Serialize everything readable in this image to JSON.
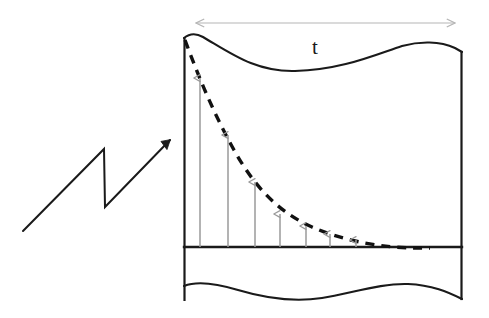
{
  "figure": {
    "kind": "diagram",
    "background_color": "#ffffff",
    "width": 489,
    "height": 318,
    "stroke_color": "#1a1a1a",
    "dash_color": "#111111",
    "arrow_color": "#9a9a9a",
    "dimension_color": "#b5b5b5"
  },
  "dimension_arrow": {
    "label": "t",
    "label_x": 312,
    "label_y": 37,
    "line_y": 23,
    "x_start": 196,
    "x_end": 455,
    "double_headed": true,
    "color": "#b5b5b5"
  },
  "panel": {
    "left": 184,
    "right": 462,
    "top_wave_y": 38,
    "baseline_y": 247,
    "bottom_wave_y": 292,
    "bottom_edge_y": 300,
    "top_wave_path": "M 184 38 C 190 33, 196 33, 203 37 C 232 54, 256 72, 295 71 C 340 70, 372 56, 402 46 C 420 41, 440 41, 455 48 L 462 52",
    "bottom_wave_path": "M 184 286 C 196 281, 215 283, 238 290 C 268 299, 296 302, 322 298 C 352 293, 382 283, 408 284 C 432 285, 448 292, 462 299"
  },
  "decay_curve": {
    "style": "dashed",
    "dash_pattern": "9 7",
    "path": "M 185 40 C 199 78, 214 114, 234 150 C 254 186, 278 212, 312 227 C 346 242, 382 247, 412 248 L 430 248",
    "color": "#111111",
    "width": 3.4
  },
  "impulse_arrows": {
    "color": "#9a9a9a",
    "baseline_y": 247,
    "items": [
      {
        "x": 200,
        "top_y": 76
      },
      {
        "x": 228,
        "top_y": 133
      },
      {
        "x": 255,
        "top_y": 180
      },
      {
        "x": 280,
        "top_y": 212
      },
      {
        "x": 306,
        "top_y": 224
      },
      {
        "x": 330,
        "top_y": 232
      },
      {
        "x": 356,
        "top_y": 238
      }
    ]
  },
  "callout_arrow": {
    "description": "zigzag lightning pointer",
    "path": "M 23 231 L 104 149 L 105 207 L 173 137",
    "head_tip_x": 175,
    "head_tip_y": 136,
    "color": "#1a1a1a",
    "width": 2
  }
}
